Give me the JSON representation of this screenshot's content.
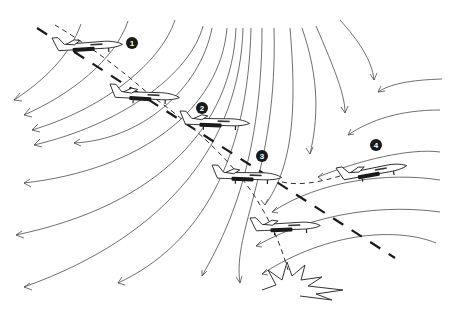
{
  "diagram": {
    "title": "",
    "markers": [
      {
        "id": "1",
        "label": "1",
        "x": 132,
        "y": 43
      },
      {
        "id": "2",
        "label": "2",
        "x": 202,
        "y": 108
      },
      {
        "id": "3",
        "label": "3",
        "x": 262,
        "y": 156
      },
      {
        "id": "4",
        "label": "4",
        "x": 376,
        "y": 145
      }
    ],
    "aircraft": [
      {
        "id": "aircraft-1",
        "x": 52,
        "y": 38,
        "w": 68,
        "pitch": -3
      },
      {
        "id": "aircraft-2",
        "x": 110,
        "y": 84,
        "w": 70,
        "pitch": 3
      },
      {
        "id": "aircraft-3",
        "x": 180,
        "y": 111,
        "w": 70,
        "pitch": 2
      },
      {
        "id": "aircraft-4",
        "x": 212,
        "y": 165,
        "w": 70,
        "pitch": 2
      },
      {
        "id": "aircraft-5",
        "x": 336,
        "y": 156,
        "w": 70,
        "pitch": -10
      },
      {
        "id": "aircraft-6",
        "x": 250,
        "y": 218,
        "w": 72,
        "pitch": -2
      }
    ],
    "paths": {
      "intended_glide_path": "dashed heavy line",
      "actual_flight_path": "dashed thin line",
      "go_around_path": "dashed thin line to aircraft 4"
    },
    "impact_burst": {
      "x": 300,
      "y": 280
    },
    "colors": {
      "background": "#ffffff",
      "ink": "#1a1a1a",
      "flow_lines": "#4a4a4a"
    }
  }
}
